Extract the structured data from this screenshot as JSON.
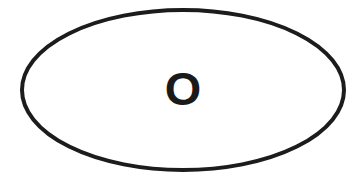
{
  "canvas": {
    "width": 362,
    "height": 179,
    "background_color": "#ffffff"
  },
  "diagram": {
    "type": "single-node-ellipse",
    "shapes": [
      {
        "name": "outer-ellipse",
        "kind": "ellipse",
        "center_x": 183,
        "center_y": 90,
        "radius_x": 161,
        "radius_y": 80,
        "stroke_color": "#1c1c1c",
        "stroke_width": 4,
        "fill_color": "none"
      }
    ],
    "labels": [
      {
        "name": "center-letter",
        "text": "O",
        "x": 183,
        "y": 88,
        "color": "#1a1a1a",
        "font_size": 46,
        "font_weight": "bold"
      }
    ]
  },
  "colors": {
    "ink": "#1c1c1c",
    "paper": "#ffffff"
  }
}
